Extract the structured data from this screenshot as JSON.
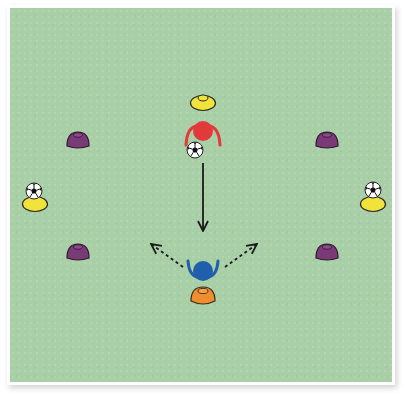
{
  "diagram": {
    "type": "soccer-drill",
    "field": {
      "color": "#a9cfa7",
      "border_color": "#ffffff"
    },
    "colors": {
      "yellow_cone": "#f2e33a",
      "purple_cone": "#7a3a78",
      "orange_cone": "#ef8e2e",
      "red_player": "#e23a3a",
      "blue_player": "#1f5fab",
      "arrow": "#1a1a1a"
    },
    "cones": [
      {
        "id": "top-yellow",
        "color": "yellow",
        "x": 203,
        "y": 101
      },
      {
        "id": "top-left-purple",
        "color": "purple",
        "x": 78,
        "y": 140
      },
      {
        "id": "top-right-purple",
        "color": "purple",
        "x": 327,
        "y": 140
      },
      {
        "id": "left-yellow",
        "color": "yellow",
        "x": 35,
        "y": 202,
        "has_ball": true
      },
      {
        "id": "right-yellow",
        "color": "yellow",
        "x": 373,
        "y": 202,
        "has_ball": true
      },
      {
        "id": "bottom-left-purple",
        "color": "purple",
        "x": 78,
        "y": 252
      },
      {
        "id": "bottom-right-purple",
        "color": "purple",
        "x": 327,
        "y": 252
      },
      {
        "id": "bottom-orange",
        "color": "orange",
        "x": 203,
        "y": 296
      }
    ],
    "players": [
      {
        "id": "attacker",
        "color": "red",
        "x": 203,
        "y": 131
      },
      {
        "id": "defender",
        "color": "blue",
        "x": 203,
        "y": 271
      }
    ],
    "balls": [
      {
        "id": "attacker-ball",
        "x": 195,
        "y": 150
      },
      {
        "id": "left-ball",
        "x": 34,
        "y": 191
      },
      {
        "id": "right-ball",
        "x": 373,
        "y": 190
      }
    ],
    "arrows": [
      {
        "id": "pass-arrow",
        "style": "solid",
        "from": [
          203,
          163
        ],
        "to": [
          203,
          231
        ]
      },
      {
        "id": "move-left-arrow",
        "style": "dashed",
        "from": [
          183,
          267
        ],
        "to": [
          151,
          244
        ]
      },
      {
        "id": "move-right-arrow",
        "style": "dashed",
        "from": [
          225,
          267
        ],
        "to": [
          257,
          244
        ]
      }
    ]
  }
}
